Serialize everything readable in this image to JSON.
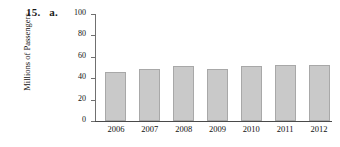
{
  "problem": {
    "number": "15.",
    "part": "a."
  },
  "chart_data": {
    "type": "bar",
    "title": "",
    "xlabel": "",
    "ylabel": "Millions of Passengers",
    "categories": [
      "2006",
      "2007",
      "2008",
      "2009",
      "2010",
      "2011",
      "2012"
    ],
    "values": [
      46,
      49,
      51,
      49,
      51,
      52,
      52
    ],
    "ylim": [
      0,
      100
    ],
    "yticks": [
      0,
      20,
      40,
      60,
      80,
      100
    ],
    "ytick_labels": [
      "0",
      "20",
      "40",
      "60",
      "80",
      "100"
    ],
    "grid": false,
    "legend": false,
    "bar_color": "#c9c9c9",
    "bar_edge_color": "#a8a8a8",
    "axis_color": "#707070"
  }
}
